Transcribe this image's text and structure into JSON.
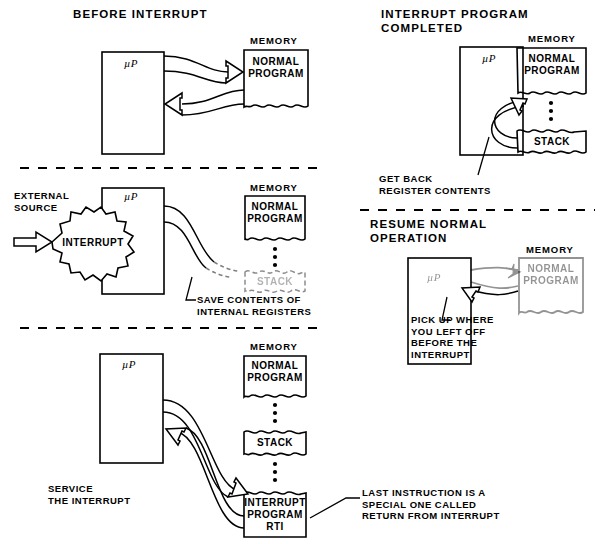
{
  "figure": {
    "ink_color": "#000000",
    "background": "#ffffff"
  },
  "panels": [
    {
      "id": "before-interrupt",
      "title": "BEFORE INTERRUPT",
      "cpu_label": "µP",
      "memory_header": "MEMORY",
      "memory_blocks": [
        {
          "name": "normal-program",
          "text": "NORMAL\nPROGRAM",
          "torn_bottom": true
        }
      ],
      "annotations": []
    },
    {
      "id": "interrupt-received",
      "title": "",
      "cpu_label": "µP",
      "memory_header": "MEMORY",
      "source_label": "EXTERNAL\nSOURCE",
      "burst_label": "INTERRUPT",
      "memory_blocks": [
        {
          "name": "normal-program",
          "text": "NORMAL\nPROGRAM",
          "torn_bottom": true
        },
        {
          "name": "stack",
          "text": "STACK",
          "torn_bottom": true,
          "faded": true
        }
      ],
      "annotations": [
        {
          "name": "save-contents",
          "text": "SAVE CONTENTS OF\nINTERNAL REGISTERS"
        }
      ]
    },
    {
      "id": "service-the-interrupt",
      "title": "",
      "cpu_label": "µP",
      "memory_header": "MEMORY",
      "caption": "SERVICE\nTHE INTERRUPT",
      "memory_blocks": [
        {
          "name": "normal-program",
          "text": "NORMAL\nPROGRAM",
          "torn_bottom": true
        },
        {
          "name": "stack",
          "text": "STACK",
          "torn_bottom": true
        },
        {
          "name": "interrupt-program",
          "text": "INTERRUPT\nPROGRAM\nRTI",
          "torn_bottom": false
        }
      ],
      "annotations": [
        {
          "name": "rti-note",
          "text": "LAST INSTRUCTION IS A\nSPECIAL ONE CALLED\nRETURN FROM INTERRUPT"
        }
      ]
    },
    {
      "id": "interrupt-program-completed",
      "title": "INTERRUPT PROGRAM\nCOMPLETED",
      "cpu_label": "µP",
      "memory_header": "MEMORY",
      "memory_blocks": [
        {
          "name": "normal-program",
          "text": "NORMAL\nPROGRAM",
          "torn_bottom": true
        },
        {
          "name": "stack",
          "text": "STACK",
          "torn_bottom": true
        }
      ],
      "annotations": [
        {
          "name": "get-back-registers",
          "text": "GET BACK\nREGISTER CONTENTS"
        }
      ]
    },
    {
      "id": "resume-normal-operation",
      "title": "RESUME NORMAL\nOPERATION",
      "cpu_label": "µP",
      "memory_header": "MEMORY",
      "memory_blocks": [
        {
          "name": "normal-program",
          "text": "NORMAL\nPROGRAM",
          "torn_bottom": true,
          "faded": true
        }
      ],
      "annotations": [
        {
          "name": "pick-up-note",
          "text": "PICK UP WHERE\nYOU LEFT OFF\nBEFORE THE\nINTERRUPT"
        }
      ]
    }
  ],
  "text": {
    "p1_title": "BEFORE INTERRUPT",
    "p1_memory": "MEMORY",
    "p1_normal": "NORMAL\nPROGRAM",
    "p1_cpu": "µP",
    "p2_cpu": "µP",
    "p2_memory": "MEMORY",
    "p2_source": "EXTERNAL\nSOURCE",
    "p2_burst": "INTERRUPT",
    "p2_normal": "NORMAL\nPROGRAM",
    "p2_stack": "STACK",
    "p2_save": "SAVE CONTENTS OF\nINTERNAL REGISTERS",
    "p3_cpu": "µP",
    "p3_memory": "MEMORY",
    "p3_normal": "NORMAL\nPROGRAM",
    "p3_stack": "STACK",
    "p3_interrupt": "INTERRUPT\nPROGRAM\nRTI",
    "p3_caption": "SERVICE\nTHE INTERRUPT",
    "p3_note": "LAST INSTRUCTION IS A\nSPECIAL ONE CALLED\nRETURN FROM INTERRUPT",
    "p4_title": "INTERRUPT PROGRAM\nCOMPLETED",
    "p4_cpu": "µP",
    "p4_memory": "MEMORY",
    "p4_normal": "NORMAL\nPROGRAM",
    "p4_stack": "STACK",
    "p4_note": "GET BACK\nREGISTER CONTENTS",
    "p5_title": "RESUME NORMAL\nOPERATION",
    "p5_cpu": "µP",
    "p5_memory": "MEMORY",
    "p5_normal": "NORMAL\nPROGRAM",
    "p5_note": "PICK UP WHERE\nYOU LEFT OFF\nBEFORE THE\nINTERRUPT"
  }
}
